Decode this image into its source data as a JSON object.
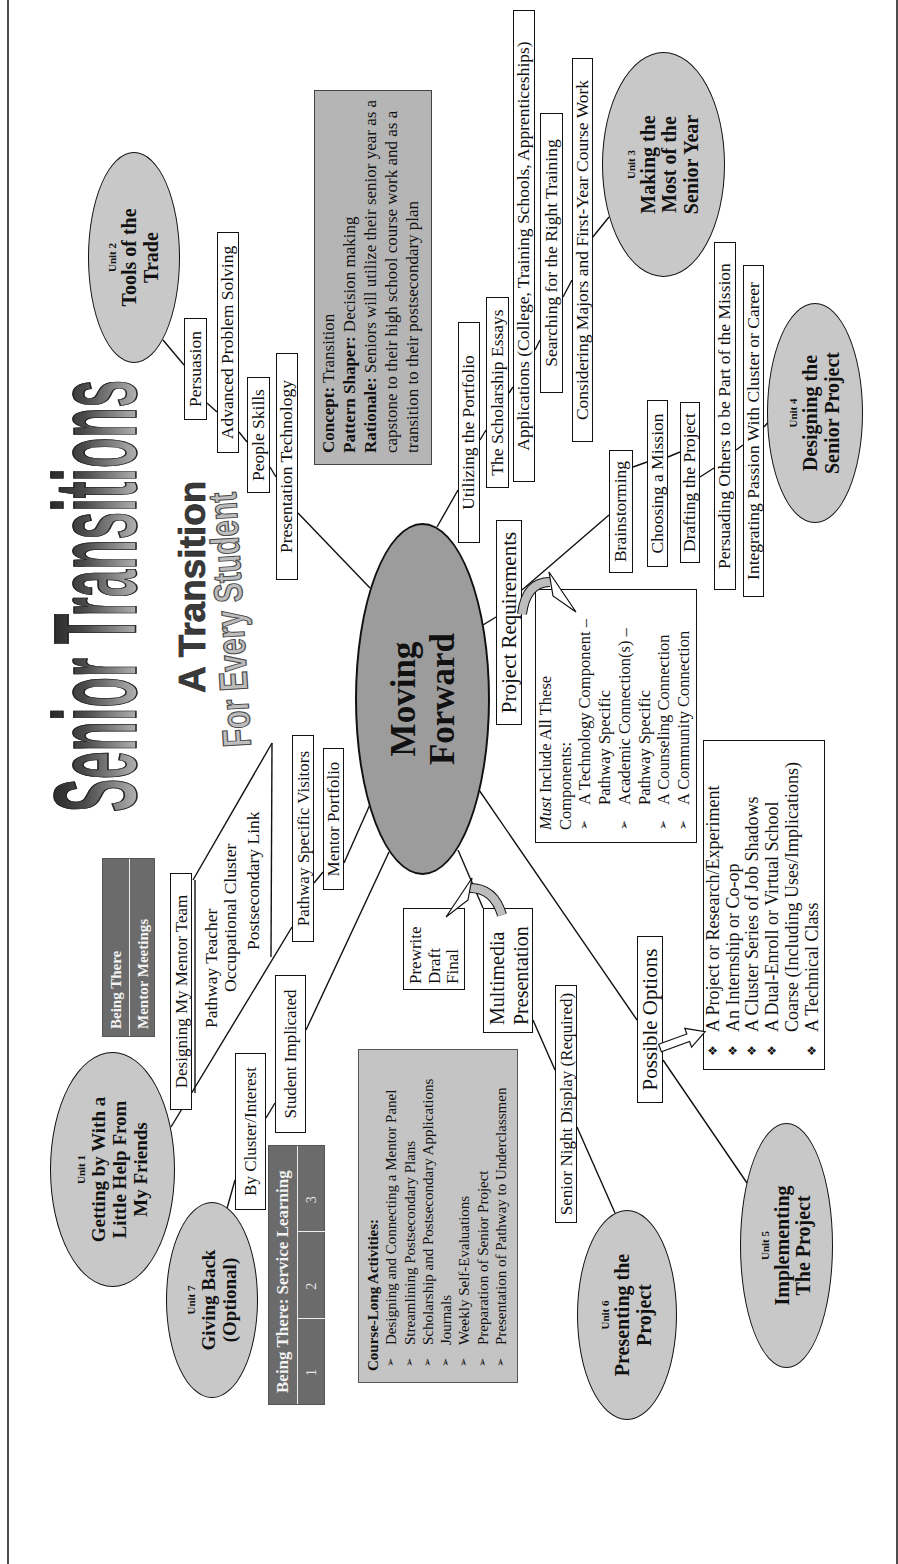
{
  "title": {
    "main": "Senior Transitions",
    "subtitle": "A Transition",
    "tagline": "For Every Student"
  },
  "center": {
    "label": "Moving\nForward"
  },
  "units": {
    "u1": {
      "num": "Unit 1",
      "name": "Getting by With a\nLittle Help From\nMy Friends"
    },
    "u2": {
      "num": "Unit 2",
      "name": "Tools of the\nTrade"
    },
    "u3": {
      "num": "Unit 3",
      "name": "Making the\nMost of the\nSenior Year"
    },
    "u4": {
      "num": "Unit 4",
      "name": "Designing the\nSenior Project"
    },
    "u5": {
      "num": "Unit 5",
      "name": "Implementing\nThe Project"
    },
    "u6": {
      "num": "Unit 6",
      "name": "Presenting the\nProject"
    },
    "u7": {
      "num": "Unit 7",
      "name": "Giving Back\n(Optional)"
    }
  },
  "concept": {
    "concept_label": "Concept:",
    "concept_value": "Transition",
    "pattern_label": "Pattern Shaper:",
    "pattern_value": "Decision making",
    "rationale_label": "Rationale:",
    "rationale_value": "Seniors will utilize their senior year as a capstone to their high school course work and as a transition to their postsecondary plan"
  },
  "unit1": {
    "mentor_team": "Designing My Mentor Team",
    "callout": [
      "Pathway Teacher",
      "Occupational Cluster",
      "Postsecondary Link"
    ],
    "pathway_visitors": "Pathway Specific Visitors",
    "mentor_portfolio": "Mentor Portfolio"
  },
  "mentor_meetings": {
    "row1": "Being There",
    "row2": "Mentor Meetings"
  },
  "unit2": {
    "items": [
      "Persuasion",
      "Advanced Problem Solving",
      "People Skills",
      "Presentation Technology"
    ]
  },
  "unit3": {
    "items": [
      "Utilizing the Portfolio",
      "The Scholarship Essays",
      "Applications (College, Training Schools, Apprenticeships)",
      "Searching for the Right Training",
      "Considering Majors and First-Year Course Work"
    ]
  },
  "unit4": {
    "project_requirements": "Project Requirements",
    "items": [
      "Brainstorming",
      "Choosing a Mission",
      "Drafting the Project",
      "Persuading Others to be Part of the Mission",
      "Integrating Passion With Cluster or Career"
    ]
  },
  "requirements": {
    "intro_em": "Must",
    "intro_rest": " Include All These Components:",
    "items": [
      "A Technology Component –\nPathway Specific",
      "Academic Connection(s) –\nPathway Specific",
      "A Counseling Connection",
      "A Community Connection"
    ]
  },
  "unit5": {
    "possible_options": "Possible Options",
    "options": [
      "A Project or Research/Experiment",
      "An Internship or Co-op",
      "A Cluster Series of Job Shadows",
      "A Dual-Enroll or Virtual School\nCoarse (Including Uses/Implications)",
      "A Technical Class"
    ]
  },
  "unit6": {
    "drafts": "Prewrite\nDraft\nFinal",
    "multimedia": "Multimedia\nPresentation",
    "senior_night": "Senior Night Display (Required)"
  },
  "unit7": {
    "by_cluster": "By Cluster/Interest",
    "student_implicated": "Student Implicated"
  },
  "service_learning": {
    "header": "Being There: Service Learning",
    "cells": [
      "1",
      "2",
      "3"
    ]
  },
  "course_long": {
    "header": "Course-Long Activities:",
    "items": [
      "Designing and Connecting a Mentor Panel",
      "Streamlining Postsecondary Plans",
      "Scholarship and Postsecondary Applications",
      "Journals",
      "Weekly Self-Evaluations",
      "Preparation of Senior Project",
      "Presentation of Pathway to Underclassmen"
    ]
  },
  "icons": {
    "arrow_bullet": "➢",
    "diamond_bullet": "❖"
  },
  "colors": {
    "unit_oval": "#c8c8c8",
    "center_oval": "#9c9c9c",
    "concept_box": "#b5b5b5",
    "activities_box": "#c4c4c4",
    "being_there": "#6b6b6b"
  }
}
